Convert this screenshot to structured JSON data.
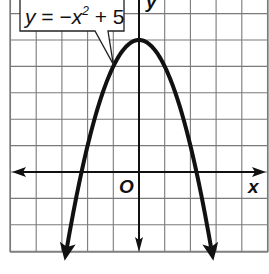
{
  "chart_data": {
    "type": "line",
    "title": "",
    "equation": "y = −x² + 5",
    "equation_parts": {
      "lhs": "y",
      "eq": "=",
      "minus": "−",
      "var": "x",
      "exp": "2",
      "plus": "+",
      "const": "5"
    },
    "xlabel": "x",
    "ylabel": "y",
    "origin_label": "O",
    "xlim": [
      -5.1,
      4.9
    ],
    "ylim": [
      -3,
      6.5
    ],
    "grid": true,
    "grid_step": 1,
    "axes_arrows": true,
    "series": [
      {
        "name": "y = -x^2 + 5",
        "function": "-x^2 + 5",
        "vertex": [
          0,
          5
        ],
        "x_intercepts": [
          -2.236,
          2.236
        ],
        "x": [
          -2.8,
          -2.5,
          -2,
          -1.5,
          -1,
          -0.5,
          0,
          0.5,
          1,
          1.5,
          2,
          2.5,
          2.8
        ],
        "values": [
          -2.84,
          -1.25,
          1,
          2.75,
          4,
          4.75,
          5,
          4.75,
          4,
          2.75,
          1,
          -1.25,
          -2.84
        ],
        "arrows_at_ends": true
      }
    ],
    "annotation": {
      "text": "y = −x² + 5",
      "points_to": [
        -1,
        4
      ]
    }
  },
  "colors": {
    "grid": "#7a7a7a",
    "axis": "#111111",
    "curve": "#111111",
    "background": "#ffffff"
  }
}
